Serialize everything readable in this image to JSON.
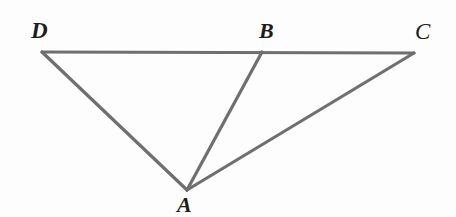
{
  "figure": {
    "type": "geometry-diagram",
    "canvas": {
      "width": 456,
      "height": 217
    },
    "background_color": "#fdfdfd",
    "stroke_color": "#6f6f6f",
    "stroke_width": 3.2,
    "label_color": "#1c1c1c",
    "points": [
      {
        "id": "D",
        "label": "D",
        "x": 42,
        "y": 52,
        "label_x": 31,
        "label_y": 19
      },
      {
        "id": "B",
        "label": "B",
        "x": 262,
        "y": 52,
        "label_x": 259,
        "label_y": 20
      },
      {
        "id": "C",
        "label": "C",
        "x": 414,
        "y": 53,
        "label_x": 415,
        "label_y": 20
      },
      {
        "id": "A",
        "label": "A",
        "x": 187,
        "y": 190,
        "label_x": 177,
        "label_y": 194
      }
    ],
    "segments": [
      {
        "id": "DC",
        "from": "D",
        "to": "C",
        "name": "top-edge-d-to-c"
      },
      {
        "id": "DA",
        "from": "D",
        "to": "A",
        "name": "edge-d-to-a"
      },
      {
        "id": "BA",
        "from": "B",
        "to": "A",
        "name": "edge-b-to-a"
      },
      {
        "id": "AC",
        "from": "A",
        "to": "C",
        "name": "edge-a-to-c"
      }
    ]
  }
}
